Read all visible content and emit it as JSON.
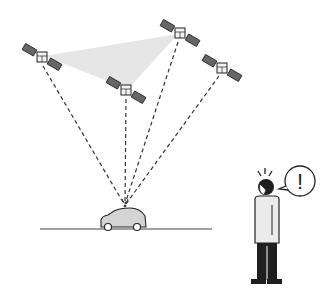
{
  "diagram": {
    "colors": {
      "line": "#222222",
      "panel": "#666666",
      "coverage": "#e6e6e6",
      "car": "#d4d4d4",
      "body_shirt": "#ebebeb",
      "dark": "#1f1f1f"
    },
    "satellites": [
      {
        "id": "sat-1",
        "x": 42,
        "y": 57
      },
      {
        "id": "sat-2",
        "x": 180,
        "y": 33
      },
      {
        "id": "sat-3",
        "x": 126,
        "y": 90
      },
      {
        "id": "sat-4",
        "x": 222,
        "y": 68
      }
    ],
    "receiver_point": {
      "x": 125,
      "y": 205
    },
    "ground": {
      "y": 229,
      "x1": 40,
      "x2": 212
    },
    "speech_bubble": {
      "text": "!"
    }
  }
}
